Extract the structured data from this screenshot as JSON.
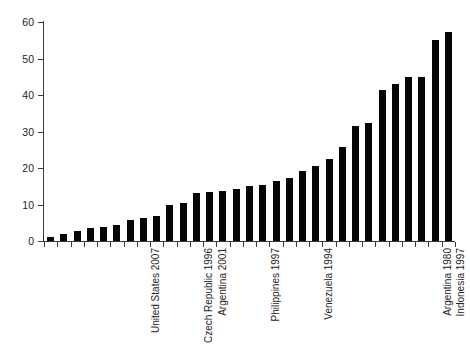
{
  "chart_data": {
    "type": "bar",
    "title": "",
    "subtitle": "",
    "xlabel": "",
    "ylabel": "",
    "ylim": [
      0,
      60
    ],
    "xlim": [
      0,
      31
    ],
    "grid": false,
    "legend": null,
    "bar_color": "#050505",
    "axis_color": "#3c3c3c",
    "background": "#ffffff",
    "y_ticks": [
      0,
      10,
      20,
      30,
      40,
      50,
      60
    ],
    "y_tick_labels": [
      "0",
      "10",
      "20",
      "30",
      "40",
      "50",
      "60"
    ],
    "n_bars": 31,
    "categories": [
      "",
      "",
      "",
      "",
      "",
      "",
      "",
      "United States 2007",
      "",
      "",
      "",
      "Czech Republic 1996",
      "Argentina 2001",
      "",
      "",
      "",
      "Philippines 1997",
      "",
      "",
      "",
      "Venezuela 1994",
      "",
      "",
      "",
      "",
      "",
      "",
      "",
      "",
      "Argentina 1980",
      "Indonesia 1997"
    ],
    "values": [
      1.2,
      2.0,
      2.7,
      3.5,
      3.8,
      4.4,
      5.8,
      6.4,
      6.9,
      10.0,
      10.4,
      13.2,
      13.5,
      13.7,
      14.3,
      15.0,
      15.3,
      16.5,
      17.3,
      19.2,
      20.5,
      22.5,
      25.8,
      31.5,
      32.2,
      41.5,
      43.0,
      45.0,
      45.0,
      55.0,
      57.2
    ],
    "labeled_points": [
      {
        "label": "United States 2007",
        "index": 7,
        "value": 6.4
      },
      {
        "label": "Czech Republic 1996",
        "index": 11,
        "value": 13.2
      },
      {
        "label": "Argentina 2001",
        "index": 12,
        "value": 13.5
      },
      {
        "label": "Philippines 1997",
        "index": 16,
        "value": 15.3
      },
      {
        "label": "Venezuela 1994",
        "index": 20,
        "value": 20.5
      },
      {
        "label": "Argentina 1980",
        "index": 29,
        "value": 55.0
      },
      {
        "label": "Indonesia 1997",
        "index": 30,
        "value": 57.2
      }
    ]
  }
}
